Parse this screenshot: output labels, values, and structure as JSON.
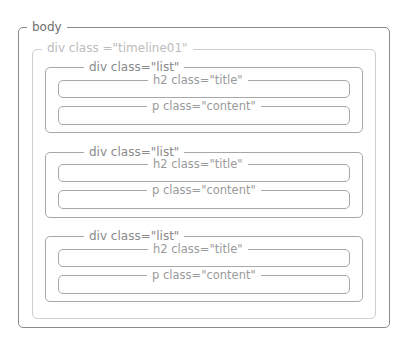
{
  "diagram": {
    "body_label": "body",
    "timeline_label": "div class =\"timeline01\"",
    "lists": [
      {
        "label": "div class=\"list\"",
        "title_label": "h2 class=\"title\"",
        "content_label": "p class=\"content\""
      },
      {
        "label": "div class=\"list\"",
        "title_label": "h2 class=\"title\"",
        "content_label": "p class=\"content\""
      },
      {
        "label": "div class=\"list\"",
        "title_label": "h2 class=\"title\"",
        "content_label": "p class=\"content\""
      }
    ]
  },
  "colors": {
    "body_border": "#8a8a8a",
    "timeline_border": "#cfcfcf",
    "list_border": "#a8a8a8"
  }
}
